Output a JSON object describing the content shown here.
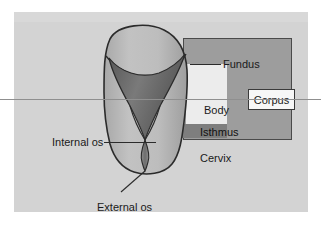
{
  "figure": {
    "background_color": "#d3d3d3",
    "panel_color": "#d3d3d3",
    "corpus_block_color": "#9d9d9d",
    "isthmus_band_color": "#7e7e7e",
    "body_region_color": "#ececec",
    "outline_color": "#2b2b2b",
    "uterus_fill": "#b9b9b9",
    "cavity_fill": "#6f6f6f"
  },
  "labels": {
    "fundus": "Fundus",
    "body": "Body",
    "isthmus": "Isthmus",
    "cervix": "Cervix",
    "corpus": "Corpus",
    "internal_os": "Internal os",
    "external_os": "External os"
  }
}
